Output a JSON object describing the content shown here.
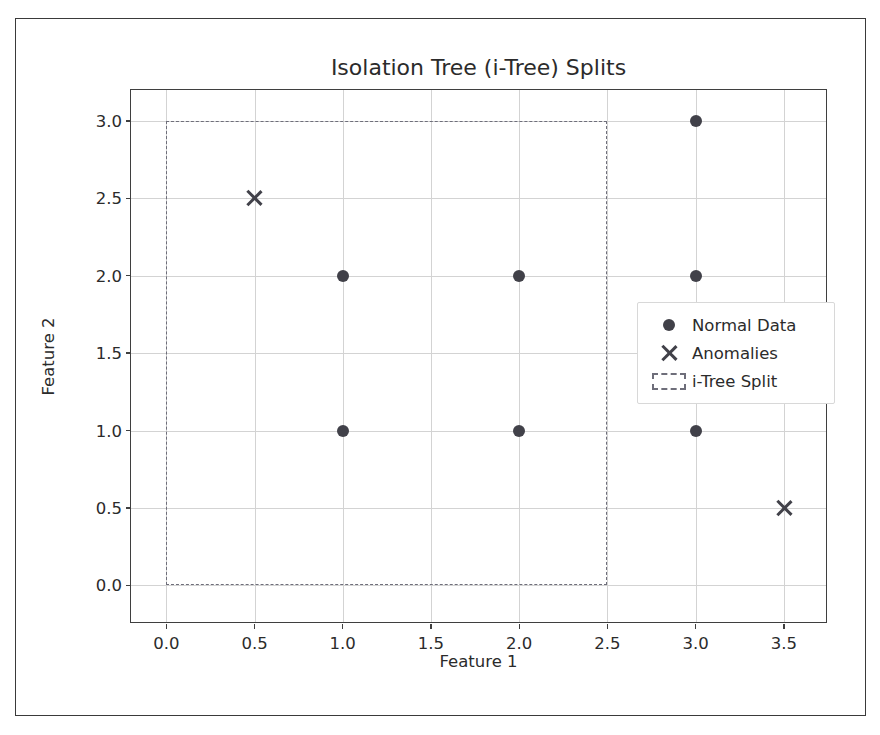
{
  "chart_data": {
    "type": "scatter",
    "title": "Isolation Tree (i-Tree) Splits",
    "xlabel": "Feature 1",
    "ylabel": "Feature 2",
    "xlim": [
      -0.2,
      3.75
    ],
    "ylim": [
      -0.25,
      3.2
    ],
    "xticks": [
      "0.0",
      "0.5",
      "1.0",
      "1.5",
      "2.0",
      "2.5",
      "3.0",
      "3.5"
    ],
    "xtick_values": [
      0.0,
      0.5,
      1.0,
      1.5,
      2.0,
      2.5,
      3.0,
      3.5
    ],
    "yticks": [
      "0.0",
      "0.5",
      "1.0",
      "1.5",
      "2.0",
      "2.5",
      "3.0"
    ],
    "ytick_values": [
      0.0,
      0.5,
      1.0,
      1.5,
      2.0,
      2.5,
      3.0
    ],
    "grid": true,
    "legend_position": "center right",
    "series": [
      {
        "name": "Normal Data",
        "marker": "circle",
        "color": "#414149",
        "points": [
          {
            "x": 1.0,
            "y": 2.0
          },
          {
            "x": 2.0,
            "y": 2.0
          },
          {
            "x": 3.0,
            "y": 2.0
          },
          {
            "x": 1.0,
            "y": 1.0
          },
          {
            "x": 2.0,
            "y": 1.0
          },
          {
            "x": 3.0,
            "y": 1.0
          },
          {
            "x": 3.0,
            "y": 3.0
          }
        ]
      },
      {
        "name": "Anomalies",
        "marker": "x",
        "color": "#414149",
        "points": [
          {
            "x": 0.5,
            "y": 2.5
          },
          {
            "x": 3.5,
            "y": 0.5
          }
        ]
      }
    ],
    "split_regions": [
      {
        "name": "i-Tree Split",
        "x0": 0.0,
        "y0": 0.0,
        "x1": 2.5,
        "y1": 3.0,
        "style": "dashed",
        "color": "#6e6e7a"
      }
    ],
    "legend": [
      {
        "label": "Normal Data",
        "marker": "circle"
      },
      {
        "label": "Anomalies",
        "marker": "x"
      },
      {
        "label": "i-Tree Split",
        "marker": "dashed-rect"
      }
    ]
  },
  "colors": {
    "marker": "#414149",
    "split": "#6e6e7a",
    "grid": "#d3d3d3",
    "axis": "#3f3f3f",
    "text": "#2b2b2b",
    "frame": "#3a3a3a",
    "background": "#ffffff"
  }
}
